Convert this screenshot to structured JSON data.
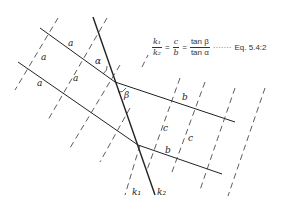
{
  "figure": {
    "equation": {
      "lhs_num": "k₁",
      "lhs_den": "k₂",
      "eq1": "=",
      "mid_num": "c",
      "mid_den": "b",
      "eq2": "=",
      "rhs_num": "tan β",
      "rhs_den": "tan α",
      "leader": "·······",
      "ref": "Eq. 5.4:2"
    },
    "labels": {
      "a1": "a",
      "a2": "a",
      "a3": "a",
      "a4": "a",
      "alpha": "α",
      "beta": "β",
      "b1": "b",
      "b2": "b",
      "c1": "c",
      "c2": "c",
      "k1": "k₁",
      "k2": "k₂"
    },
    "colors": {
      "line": "#222222",
      "dash": "#333333",
      "background": "#ffffff"
    }
  }
}
